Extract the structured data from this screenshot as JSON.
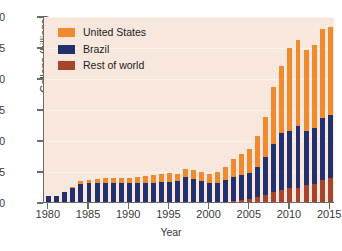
{
  "chart_data": {
    "type": "bar",
    "stacked": true,
    "title": "",
    "xlabel": "Year",
    "ylabel": "Gallons (billions)",
    "xlim": [
      1979.4,
      2015.6
    ],
    "ylim": [
      0,
      30
    ],
    "ytick_values": [
      0,
      5,
      10,
      15,
      20,
      25,
      30
    ],
    "ytick_labels": [
      "0",
      "5",
      "10",
      "15",
      "20",
      "25",
      "30"
    ],
    "xtick_values": [
      1980,
      1985,
      1990,
      1995,
      2000,
      2005,
      2010,
      2015
    ],
    "xtick_labels": [
      "1980",
      "1985",
      "1990",
      "1995",
      "2000",
      "2005",
      "2010",
      "2015"
    ],
    "grid": true,
    "legend_position": "top-left",
    "categories": [
      1980,
      1981,
      1982,
      1983,
      1984,
      1985,
      1986,
      1987,
      1988,
      1989,
      1990,
      1991,
      1992,
      1993,
      1994,
      1995,
      1996,
      1997,
      1998,
      1999,
      2000,
      2001,
      2002,
      2003,
      2004,
      2005,
      2006,
      2007,
      2008,
      2009,
      2010,
      2011,
      2012,
      2013,
      2014,
      2015
    ],
    "series": [
      {
        "name": "Rest of world",
        "color": "#a8432c",
        "values": [
          0,
          0,
          0,
          0,
          0,
          0,
          0,
          0,
          0,
          0,
          0,
          0,
          0,
          0,
          0,
          0,
          0,
          0,
          0,
          0,
          0,
          0,
          0,
          0.2,
          0.4,
          0.5,
          0.8,
          1.1,
          1.6,
          1.9,
          2.2,
          2.3,
          2.7,
          2.9,
          3.5,
          3.8
        ]
      },
      {
        "name": "Brazil",
        "color": "#22306d",
        "values": [
          0.9,
          1.0,
          1.6,
          2.3,
          2.9,
          3.0,
          3.0,
          3.0,
          3.0,
          3.0,
          3.0,
          3.0,
          3.1,
          3.1,
          3.2,
          3.3,
          3.4,
          4.0,
          3.7,
          3.4,
          3.0,
          3.0,
          3.5,
          3.9,
          4.0,
          4.2,
          4.9,
          6.1,
          7.7,
          9.3,
          9.3,
          10.0,
          8.7,
          9.1,
          10.1,
          10.2
        ],
        "cumulative_top": [
          0.9,
          1.0,
          1.6,
          2.3,
          2.9,
          3.0,
          3.0,
          3.0,
          3.0,
          3.0,
          3.0,
          3.0,
          3.1,
          3.1,
          3.2,
          3.3,
          3.4,
          4.0,
          3.7,
          3.4,
          3.0,
          3.0,
          3.5,
          4.1,
          4.4,
          4.7,
          5.7,
          7.2,
          9.3,
          11.2,
          11.5,
          12.3,
          11.4,
          12.0,
          13.6,
          14.0
        ]
      },
      {
        "name": "United States",
        "color": "#f08a2e",
        "values": [
          0,
          0,
          0,
          0.1,
          0.5,
          0.6,
          0.7,
          0.8,
          0.8,
          0.9,
          0.9,
          1.0,
          1.1,
          1.2,
          1.3,
          1.4,
          1.1,
          1.3,
          1.4,
          1.5,
          1.6,
          1.8,
          2.1,
          2.8,
          3.4,
          3.9,
          4.9,
          6.5,
          9.2,
          10.8,
          13.3,
          13.9,
          13.2,
          13.3,
          14.3,
          14.3
        ]
      }
    ],
    "totals": [
      0.9,
      1.0,
      1.6,
      2.4,
      3.4,
      3.6,
      3.7,
      3.8,
      3.8,
      3.9,
      3.9,
      4.0,
      4.2,
      4.3,
      4.5,
      4.7,
      4.5,
      5.3,
      5.1,
      4.9,
      4.6,
      4.8,
      5.6,
      6.9,
      7.8,
      8.6,
      10.6,
      13.7,
      18.5,
      22.0,
      24.8,
      26.2,
      24.6,
      25.3,
      27.9,
      28.3
    ]
  },
  "legend": {
    "items": [
      {
        "label": "United States",
        "color": "#f08a2e"
      },
      {
        "label": "Brazil",
        "color": "#22306d"
      },
      {
        "label": "Rest of world",
        "color": "#a8432c"
      }
    ]
  },
  "axes": {
    "y_axis_title": "Gallons (billions)",
    "x_axis_title": "Year"
  },
  "colors": {
    "plot_background": "#f7e7dc",
    "page_background": "#ffffff",
    "axis_line": "#6b6b6b",
    "gridline": "#fcf4ee",
    "text": "#3a3a3a"
  }
}
